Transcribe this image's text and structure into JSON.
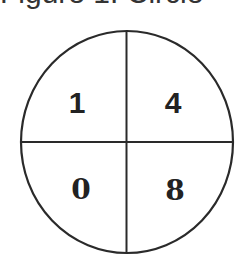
{
  "header": {
    "partial_text": "Figure 1: Circle"
  },
  "diagram": {
    "shape": "circle divided into four quadrants",
    "stroke_color": "#2a2a2a",
    "background": "#ffffff",
    "quadrants": [
      {
        "position": "top-left",
        "value": "1"
      },
      {
        "position": "top-right",
        "value": "4"
      },
      {
        "position": "bottom-left",
        "value": "0"
      },
      {
        "position": "bottom-right",
        "value": "8"
      }
    ]
  }
}
